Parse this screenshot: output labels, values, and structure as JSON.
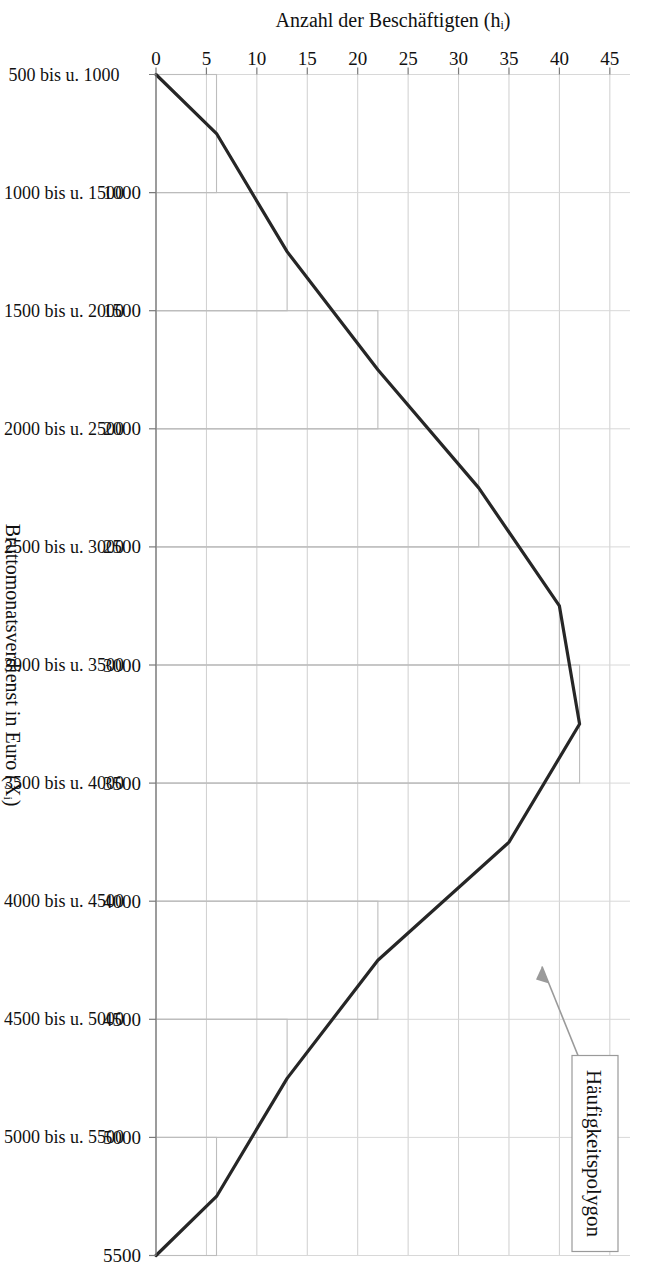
{
  "figure": {
    "kind": "histogram-with-frequency-polygon",
    "language": "de"
  },
  "axes": {
    "x_title": "Bruttomonatsverdienst in Euro (Xᵢ)",
    "y_title": "Anzahl der Beschäftigten (hᵢ)",
    "y_ticks": [
      "0",
      "5",
      "10",
      "15",
      "20",
      "25",
      "30",
      "35",
      "40",
      "45"
    ],
    "x_tick_labels": [
      "500",
      "1000",
      "1500",
      "2000",
      "2500",
      "3000",
      "3500",
      "4000",
      "4500",
      "5000",
      "5500"
    ],
    "x_class_labels": [
      "500 bis u. 1000",
      "1000 bis u. 1500",
      "1500 bis u. 2000",
      "2000 bis u. 2500",
      "2500 bis u. 3000",
      "3000 bis u. 3500",
      "3500 bis u. 4000",
      "4000 bis u. 4500",
      "4500 bis u. 5000",
      "5000 bis u. 5500"
    ]
  },
  "annotation": {
    "label": "Häufigkeitspolygon"
  },
  "colors": {
    "bar_stroke": "#bdbdbd",
    "polygon": "#262626",
    "grid": "#cfcfcf",
    "callout_border": "#9a9a9a",
    "text": "#111111"
  },
  "chart_data": {
    "type": "bar",
    "title": "",
    "subtitle": "",
    "xlabel": "Bruttomonatsverdienst in Euro (Xᵢ)",
    "ylabel": "Anzahl der Beschäftigten (hᵢ)",
    "ylim": [
      0,
      47
    ],
    "xlim": [
      500,
      5500
    ],
    "grid": true,
    "legend": "none",
    "class_width": 500,
    "categories": [
      "500 bis u. 1000",
      "1000 bis u. 1500",
      "1500 bis u. 2000",
      "2000 bis u. 2500",
      "2500 bis u. 3000",
      "3000 bis u. 3500",
      "3500 bis u. 4000",
      "4000 bis u. 4500",
      "4500 bis u. 5000",
      "5000 bis u. 5500"
    ],
    "class_lower": [
      500,
      1000,
      1500,
      2000,
      2500,
      3000,
      3500,
      4000,
      4500,
      5000
    ],
    "class_upper": [
      1000,
      1500,
      2000,
      2500,
      3000,
      3500,
      4000,
      4500,
      5000,
      5500
    ],
    "class_midpoints": [
      750,
      1250,
      1750,
      2250,
      2750,
      3250,
      3750,
      4250,
      4750,
      5250
    ],
    "values": [
      6,
      13,
      22,
      32,
      40,
      42,
      35,
      22,
      13,
      6
    ],
    "series": [
      {
        "name": "Häufigkeitspolygon",
        "type": "line",
        "x": [
          500,
          750,
          1250,
          1750,
          2250,
          2750,
          3250,
          3750,
          4250,
          4750,
          5250,
          5500
        ],
        "values": [
          0,
          6,
          13,
          22,
          32,
          40,
          42,
          35,
          22,
          13,
          6,
          0
        ]
      }
    ],
    "annotations": [
      {
        "text": "Häufigkeitspolygon",
        "points_to_x": 3600,
        "points_to_y": 38
      }
    ]
  }
}
